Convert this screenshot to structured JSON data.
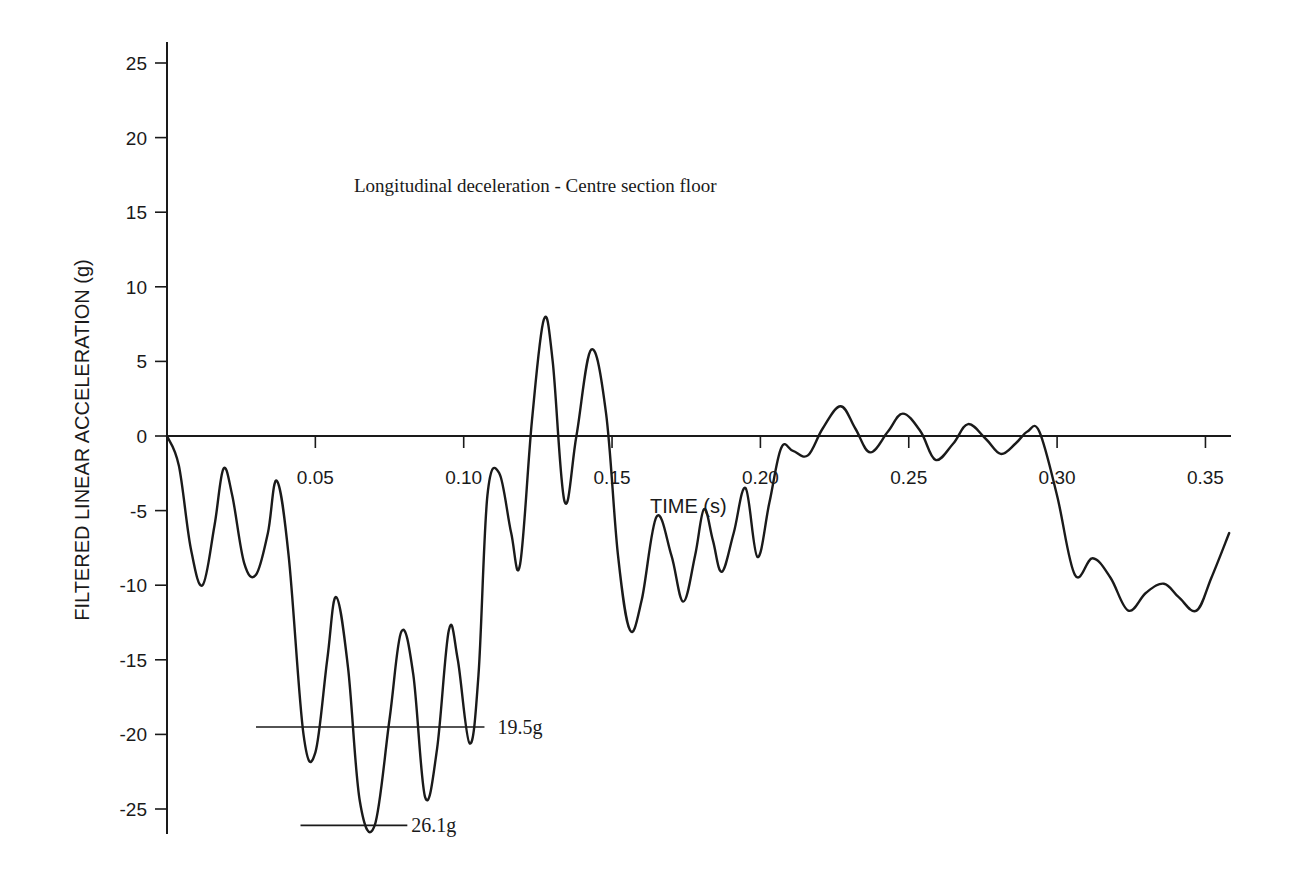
{
  "chart_data": {
    "type": "line",
    "title": "Longitudinal deceleration - Centre section floor",
    "xlabel": "TIME (s)",
    "ylabel": "FILTERED LINEAR ACCELERATION (g)",
    "xlim": [
      0,
      0.36
    ],
    "ylim": [
      -26.5,
      26.5
    ],
    "xticks": [
      0.05,
      0.1,
      0.15,
      0.2,
      0.25,
      0.3,
      0.35
    ],
    "xtick_labels": [
      "0.05",
      "0.10",
      "0.15",
      "0.20",
      "0.25",
      "0.30",
      "0.35"
    ],
    "yticks": [
      25,
      20,
      15,
      10,
      5,
      0,
      -5,
      -10,
      -15,
      -20,
      -25
    ],
    "ytick_labels": [
      "25",
      "20",
      "15",
      "10",
      "5",
      "0",
      "-5",
      "-10",
      "-15",
      "-20",
      "-25"
    ],
    "grid": false,
    "legend": null,
    "series": [
      {
        "name": "Longitudinal deceleration - Centre section floor",
        "x": [
          0.0,
          0.004,
          0.008,
          0.012,
          0.016,
          0.019,
          0.022,
          0.026,
          0.03,
          0.034,
          0.037,
          0.041,
          0.046,
          0.05,
          0.054,
          0.057,
          0.061,
          0.065,
          0.07,
          0.075,
          0.079,
          0.083,
          0.087,
          0.091,
          0.095,
          0.098,
          0.102,
          0.105,
          0.108,
          0.112,
          0.116,
          0.119,
          0.123,
          0.127,
          0.13,
          0.134,
          0.138,
          0.143,
          0.148,
          0.152,
          0.156,
          0.16,
          0.165,
          0.17,
          0.174,
          0.178,
          0.181,
          0.184,
          0.187,
          0.191,
          0.195,
          0.199,
          0.203,
          0.207,
          0.211,
          0.216,
          0.221,
          0.227,
          0.232,
          0.237,
          0.243,
          0.248,
          0.254,
          0.259,
          0.265,
          0.27,
          0.276,
          0.281,
          0.286,
          0.29,
          0.294,
          0.3,
          0.306,
          0.312,
          0.318,
          0.324,
          0.33,
          0.336,
          0.341,
          0.347,
          0.352,
          0.358
        ],
        "values": [
          0.0,
          -2.0,
          -7.5,
          -10.0,
          -6.0,
          -2.2,
          -4.0,
          -8.5,
          -9.3,
          -6.5,
          -3.0,
          -8.0,
          -20.0,
          -21.2,
          -15.0,
          -10.8,
          -15.5,
          -24.5,
          -26.1,
          -19.0,
          -13.1,
          -16.0,
          -24.2,
          -21.0,
          -13.0,
          -15.0,
          -20.6,
          -16.0,
          -4.0,
          -2.5,
          -6.5,
          -8.6,
          1.0,
          7.8,
          5.0,
          -4.4,
          0.0,
          5.8,
          1.5,
          -8.0,
          -13.0,
          -11.0,
          -5.4,
          -8.0,
          -11.1,
          -8.0,
          -4.9,
          -7.0,
          -9.1,
          -6.5,
          -3.5,
          -8.1,
          -4.5,
          -0.8,
          -1.0,
          -1.3,
          0.5,
          2.0,
          0.5,
          -1.1,
          0.3,
          1.5,
          0.3,
          -1.6,
          -0.5,
          0.8,
          -0.2,
          -1.2,
          -0.5,
          0.3,
          0.3,
          -4.0,
          -9.3,
          -8.2,
          -9.5,
          -11.7,
          -10.5,
          -9.9,
          -10.8,
          -11.7,
          -9.5,
          -6.5
        ]
      }
    ],
    "annotations": [
      {
        "text": "19.5g",
        "y": -19.5,
        "line_x_range": [
          0.03,
          0.107
        ]
      },
      {
        "text": "26.1g",
        "y": -26.1,
        "line_x_range": [
          0.045,
          0.081
        ]
      }
    ]
  },
  "plot_area": {
    "origin_px": [
      167,
      436
    ],
    "x_px_per_unit": 2967,
    "y_px_per_unit": 14.92,
    "y_axis_top_px": 42,
    "y_axis_bottom_px": 834,
    "x_axis_end_px": 1231
  },
  "colors": {
    "line": "#1a1a1a",
    "axis": "#1a1a1a",
    "background": "#ffffff"
  }
}
